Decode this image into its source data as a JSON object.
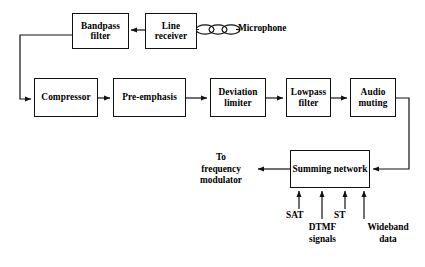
{
  "diagram": {
    "blocks": [
      {
        "id": "bandpass_filter",
        "label": "Bandpass\nfilter",
        "x": 72,
        "y": 13,
        "w": 57,
        "h": 36
      },
      {
        "id": "line_receiver",
        "label": "Line\nreceiver",
        "x": 145,
        "y": 13,
        "w": 52,
        "h": 36
      },
      {
        "id": "compressor",
        "label": "Compressor",
        "x": 34,
        "y": 78,
        "w": 64,
        "h": 39
      },
      {
        "id": "pre_emphasis",
        "label": "Pre-emphasis",
        "x": 113,
        "y": 78,
        "w": 73,
        "h": 39
      },
      {
        "id": "deviation_limiter",
        "label": "Deviation\nlimiter",
        "x": 210,
        "y": 78,
        "w": 56,
        "h": 39
      },
      {
        "id": "lowpass_filter",
        "label": "Lowpass\nfilter",
        "x": 286,
        "y": 78,
        "w": 45,
        "h": 39
      },
      {
        "id": "audio_muting",
        "label": "Audio\nmuting",
        "x": 350,
        "y": 78,
        "w": 46,
        "h": 39
      },
      {
        "id": "summing_network",
        "label": "Summing\nnetwork",
        "x": 290,
        "y": 150,
        "w": 80,
        "h": 38
      }
    ],
    "labels": [
      {
        "id": "microphone",
        "text": "Microphone",
        "x": 238,
        "y": 23,
        "align": "left"
      },
      {
        "id": "to_frequency_modulator",
        "text": "To\nfrequency\nmodulator",
        "x": 193,
        "y": 152,
        "align": "center"
      },
      {
        "id": "sat",
        "text": "SAT",
        "x": 286,
        "y": 210,
        "align": "left"
      },
      {
        "id": "dtmf_signals",
        "text": "DTMF\nsignals",
        "x": 303,
        "y": 222,
        "align": "center"
      },
      {
        "id": "st",
        "text": "ST",
        "x": 334,
        "y": 210,
        "align": "left"
      },
      {
        "id": "wideband_data",
        "text": "Wideband\ndata",
        "x": 362,
        "y": 222,
        "align": "center"
      }
    ],
    "connections": [
      {
        "id": "mic-to-line-receiver",
        "from": "microphone",
        "to": "line_receiver"
      },
      {
        "id": "line-receiver-to-bandpass",
        "from": "line_receiver",
        "to": "bandpass_filter"
      },
      {
        "id": "bandpass-to-compressor",
        "from": "bandpass_filter",
        "to": "compressor"
      },
      {
        "id": "compressor-to-pre-emphasis",
        "from": "compressor",
        "to": "pre_emphasis"
      },
      {
        "id": "pre-emphasis-to-deviation",
        "from": "pre_emphasis",
        "to": "deviation_limiter"
      },
      {
        "id": "deviation-to-lowpass",
        "from": "deviation_limiter",
        "to": "lowpass_filter"
      },
      {
        "id": "lowpass-to-audio-muting",
        "from": "lowpass_filter",
        "to": "audio_muting"
      },
      {
        "id": "audio-muting-to-summing",
        "from": "audio_muting",
        "to": "summing_network"
      },
      {
        "id": "summing-to-frequency-mod",
        "from": "summing_network",
        "to": "to_frequency_modulator"
      },
      {
        "id": "sat-to-summing",
        "from": "sat",
        "to": "summing_network"
      },
      {
        "id": "dtmf-to-summing",
        "from": "dtmf_signals",
        "to": "summing_network"
      },
      {
        "id": "st-to-summing",
        "from": "st",
        "to": "summing_network"
      },
      {
        "id": "wideband-to-summing",
        "from": "wideband_data",
        "to": "summing_network"
      }
    ],
    "colors": {
      "line": "#111111",
      "block_fill": "#ffffff",
      "text": "#000000"
    }
  }
}
